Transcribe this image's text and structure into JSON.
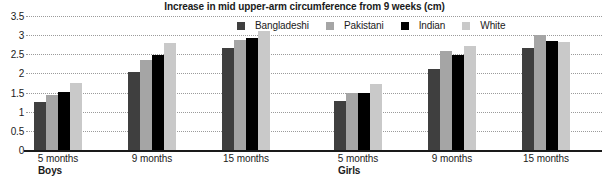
{
  "chart_data": {
    "type": "bar",
    "title": "Increase in mid upper-arm circumference from 9 weeks (cm)",
    "xlabel": "",
    "ylabel": "",
    "ylim": [
      0,
      3.5
    ],
    "ytick_labels": [
      "0",
      "0.5",
      "1",
      "1.5",
      "2",
      "2.5",
      "3",
      "3.5"
    ],
    "ytick_values": [
      0,
      0.5,
      1,
      1.5,
      2,
      2.5,
      3,
      3.5
    ],
    "grid": true,
    "legend_position": "top-right",
    "panels": [
      {
        "name": "Boys",
        "categories": [
          "5 months",
          "9 months",
          "15 months"
        ],
        "series": [
          {
            "name": "Bangladeshi",
            "color": "#3f3f3f",
            "values": [
              1.25,
              2.05,
              2.67
            ]
          },
          {
            "name": "Pakistani",
            "color": "#a5a5a5",
            "values": [
              1.45,
              2.35,
              2.88
            ]
          },
          {
            "name": "Indian",
            "color": "#000000",
            "values": [
              1.52,
              2.48,
              2.93
            ]
          },
          {
            "name": "White",
            "color": "#c9c9c9",
            "values": [
              1.75,
              2.8,
              3.1
            ]
          }
        ]
      },
      {
        "name": "Girls",
        "categories": [
          "5 months",
          "9 months",
          "15 months"
        ],
        "series": [
          {
            "name": "Bangladeshi",
            "color": "#3f3f3f",
            "values": [
              1.28,
              2.12,
              2.67
            ]
          },
          {
            "name": "Pakistani",
            "color": "#a5a5a5",
            "values": [
              1.48,
              2.58,
              3.01
            ]
          },
          {
            "name": "Indian",
            "color": "#000000",
            "values": [
              1.5,
              2.47,
              2.84
            ]
          },
          {
            "name": "White",
            "color": "#c9c9c9",
            "values": [
              1.73,
              2.72,
              2.83
            ]
          }
        ]
      }
    ],
    "legend": [
      {
        "label": "Bangladeshi",
        "color": "#3f3f3f"
      },
      {
        "label": "Pakistani",
        "color": "#a5a5a5"
      },
      {
        "label": "Indian",
        "color": "#000000"
      },
      {
        "label": "White",
        "color": "#c9c9c9"
      }
    ],
    "colors": {
      "gridline": "#9b9b9b",
      "axis": "#1a1a1a",
      "background": "#ffffff",
      "text": "#1a1a1a"
    }
  }
}
